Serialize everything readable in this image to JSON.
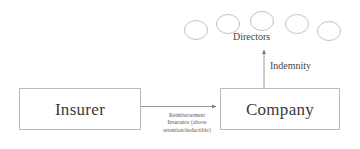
{
  "diagram": {
    "type": "flow-diagram",
    "colors": {
      "background": "#ffffff",
      "box_border": "#b9b9b9",
      "circle_stroke": "#c0c0c0",
      "arrow": "#8a8a8a",
      "box_text": "#3a3a3a",
      "label_text": "#454545",
      "caption_text": "#5a5a5a"
    },
    "nodes": [
      {
        "id": "insurer",
        "label": "Insurer",
        "shape": "rectangle",
        "x": 19,
        "y": 88,
        "width": 122,
        "height": 42
      },
      {
        "id": "company",
        "label": "Company",
        "shape": "rectangle",
        "x": 220,
        "y": 88,
        "width": 120,
        "height": 42
      }
    ],
    "directors": {
      "group_label": "Directors",
      "count": 5,
      "shape": "circle",
      "circles": [
        {
          "index": 1,
          "cx": 196,
          "cy": 30,
          "rx": 11.5,
          "ry": 9.5
        },
        {
          "index": 2,
          "cx": 228,
          "cy": 24,
          "rx": 11.5,
          "ry": 9.5
        },
        {
          "index": 3,
          "cx": 262,
          "cy": 21,
          "rx": 11.5,
          "ry": 9.5
        },
        {
          "index": 4,
          "cx": 297,
          "cy": 24,
          "rx": 11.5,
          "ry": 9.5
        },
        {
          "index": 5,
          "cx": 329,
          "cy": 31,
          "rx": 11.5,
          "ry": 9.5
        }
      ]
    },
    "edges": [
      {
        "id": "reimbursement-edge",
        "from": "insurer",
        "to": "company",
        "direction": "right",
        "label_lines": [
          "Reimbursement",
          "Insurance (above",
          "retention/deductible)"
        ],
        "label_text": "Reimbursement Insurance (above retention/deductible)"
      },
      {
        "id": "indemnity-edge",
        "from": "company",
        "to": "directors",
        "direction": "up",
        "label_lines": [
          "Indemnity"
        ],
        "label_text": "Indemnity"
      }
    ]
  }
}
